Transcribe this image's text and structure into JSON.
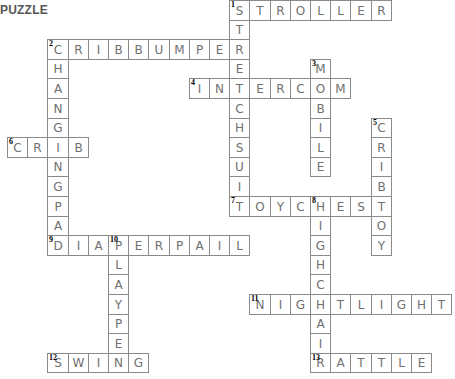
{
  "title": "PUZZLE",
  "grid": {
    "origin_x": 7,
    "origin_y": 0,
    "cell_w": 20.2,
    "cell_h": 19.6
  },
  "words": [
    {
      "number": 1,
      "answer": "STROLLER",
      "direction": "across",
      "row": 0,
      "col": 11
    },
    {
      "number": 1,
      "answer": "STRETCHSUIT",
      "direction": "down",
      "row": 0,
      "col": 11
    },
    {
      "number": 2,
      "answer": "CRIBBUMPER",
      "direction": "across",
      "row": 2,
      "col": 2
    },
    {
      "number": 2,
      "answer": "CHANGINGPAD",
      "direction": "down",
      "row": 2,
      "col": 2
    },
    {
      "number": 3,
      "answer": "MOBILE",
      "direction": "down",
      "row": 3,
      "col": 15
    },
    {
      "number": 4,
      "answer": "INTERCOM",
      "direction": "across",
      "row": 4,
      "col": 9
    },
    {
      "number": 5,
      "answer": "CRIBTOY",
      "direction": "down",
      "row": 6,
      "col": 18
    },
    {
      "number": 6,
      "answer": "CRIB",
      "direction": "across",
      "row": 7,
      "col": 0
    },
    {
      "number": 7,
      "answer": "TOYCHEST",
      "direction": "across",
      "row": 10,
      "col": 11
    },
    {
      "number": 8,
      "answer": "HIGHCHAIR",
      "direction": "down",
      "row": 10,
      "col": 15
    },
    {
      "number": 9,
      "answer": "DIAPERPAIL",
      "direction": "across",
      "row": 12,
      "col": 2
    },
    {
      "number": 10,
      "answer": "PLAYPEN",
      "direction": "down",
      "row": 12,
      "col": 5
    },
    {
      "number": 11,
      "answer": "NIGHTLIGHT",
      "direction": "across",
      "row": 15,
      "col": 12
    },
    {
      "number": 12,
      "answer": "SWING",
      "direction": "across",
      "row": 18,
      "col": 2
    },
    {
      "number": 13,
      "answer": "RATTLE",
      "direction": "across",
      "row": 18,
      "col": 15
    }
  ],
  "colors": {
    "border": "#8a8a8a",
    "letter": "#707070",
    "number": "#000000",
    "title": "#555555"
  }
}
